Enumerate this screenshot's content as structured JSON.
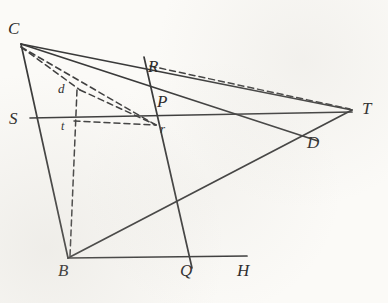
{
  "figure": {
    "kind": "hand-drawn-geometry-diagram",
    "background_color": "#fbfaf7",
    "ink_color": "#3a3a3a",
    "width": 388,
    "height": 303,
    "points": [
      {
        "id": "C",
        "label": "C",
        "x": 21,
        "y": 44,
        "label_x": 8,
        "label_y": 20,
        "size": "major"
      },
      {
        "id": "R",
        "label": "R",
        "x": 151,
        "y": 62,
        "label_x": 148,
        "label_y": 58,
        "size": "major"
      },
      {
        "id": "P",
        "label": "P",
        "x": 160,
        "y": 100,
        "label_x": 157,
        "label_y": 93,
        "size": "major"
      },
      {
        "id": "S",
        "label": "S",
        "x": 30,
        "y": 118,
        "label_x": 9,
        "label_y": 110,
        "size": "major"
      },
      {
        "id": "T",
        "label": "T",
        "x": 352,
        "y": 110,
        "label_x": 362,
        "label_y": 100,
        "size": "major"
      },
      {
        "id": "D",
        "label": "D",
        "x": 310,
        "y": 133,
        "label_x": 307,
        "label_y": 134,
        "size": "major"
      },
      {
        "id": "B",
        "label": "B",
        "x": 68,
        "y": 258,
        "label_x": 58,
        "label_y": 262,
        "size": "major"
      },
      {
        "id": "Q",
        "label": "Q",
        "x": 190,
        "y": 258,
        "label_x": 180,
        "label_y": 262,
        "size": "major"
      },
      {
        "id": "H",
        "label": "H",
        "x": 247,
        "y": 258,
        "label_x": 237,
        "label_y": 262,
        "size": "major"
      },
      {
        "id": "d",
        "label": "d",
        "x": 77,
        "y": 92,
        "label_x": 58,
        "label_y": 82,
        "size": "minor"
      },
      {
        "id": "t",
        "label": "t",
        "x": 77,
        "y": 118,
        "label_x": 61,
        "label_y": 120,
        "size": "tiny"
      },
      {
        "id": "r",
        "label": "r",
        "x": 156,
        "y": 125,
        "label_x": 160,
        "label_y": 122,
        "size": "minor"
      }
    ],
    "solid_segments": [
      {
        "name": "segment-C-B",
        "x1": 21,
        "y1": 44,
        "x2": 68,
        "y2": 258
      },
      {
        "name": "segment-C-T",
        "x1": 21,
        "y1": 44,
        "x2": 352,
        "y2": 110
      },
      {
        "name": "segment-C-D",
        "x1": 21,
        "y1": 44,
        "x2": 318,
        "y2": 141
      },
      {
        "name": "segment-S-T",
        "x1": 30,
        "y1": 118,
        "x2": 352,
        "y2": 112
      },
      {
        "name": "segment-R-Q",
        "x1": 144,
        "y1": 57,
        "x2": 192,
        "y2": 268
      },
      {
        "name": "segment-B-T",
        "x1": 68,
        "y1": 258,
        "x2": 352,
        "y2": 110
      },
      {
        "name": "segment-B-H",
        "x1": 68,
        "y1": 258,
        "x2": 247,
        "y2": 256
      }
    ],
    "dashed_segments": [
      {
        "name": "dashed-C-d",
        "x1": 21,
        "y1": 47,
        "x2": 80,
        "y2": 90
      },
      {
        "name": "dashed-d-r",
        "x1": 80,
        "y1": 90,
        "x2": 156,
        "y2": 125
      },
      {
        "name": "dashed-C-r",
        "x1": 21,
        "y1": 47,
        "x2": 156,
        "y2": 125
      },
      {
        "name": "dashed-t-r",
        "x1": 74,
        "y1": 121,
        "x2": 156,
        "y2": 125
      },
      {
        "name": "dashed-d-B",
        "x1": 77,
        "y1": 90,
        "x2": 70,
        "y2": 256
      },
      {
        "name": "dashed-R-T",
        "x1": 150,
        "y1": 66,
        "x2": 350,
        "y2": 109
      }
    ]
  }
}
